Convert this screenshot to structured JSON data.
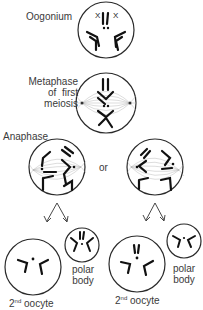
{
  "diagram": {
    "type": "meiosis-oogenesis",
    "colors": {
      "outline": "#2a2a2a",
      "chromosome": "#1a1a1a",
      "spindle": "#9a9a9a",
      "background": "#ffffff"
    },
    "stages": [
      {
        "id": "oogonium",
        "label": "Oogonium"
      },
      {
        "id": "metaphase",
        "label_lines": [
          "Metaphase",
          "of  first",
          "meiosis"
        ]
      },
      {
        "id": "anaphase",
        "label": "Anaphase",
        "connector": "or"
      }
    ],
    "products": [
      {
        "oocyte_label": "2",
        "oocyte_sup": "nd",
        "oocyte_word": "oocyte",
        "polar_label_lines": [
          "polar",
          "body"
        ]
      },
      {
        "oocyte_label": "2",
        "oocyte_sup": "nd",
        "oocyte_word": "oocyte",
        "polar_label_lines": [
          "polar",
          "body"
        ]
      }
    ],
    "chromosome_marks": {
      "x_left": "X",
      "x_right": "X"
    }
  }
}
